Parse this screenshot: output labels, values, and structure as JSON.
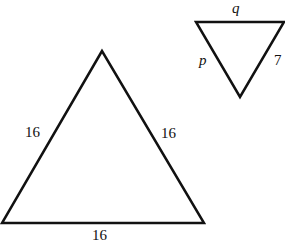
{
  "diagram": {
    "large_triangle": {
      "sides": {
        "left": "16",
        "right": "16",
        "bottom": "16"
      }
    },
    "small_triangle": {
      "sides": {
        "top": "q",
        "left": "p",
        "right": "7"
      }
    },
    "stroke_color": "#111111"
  }
}
